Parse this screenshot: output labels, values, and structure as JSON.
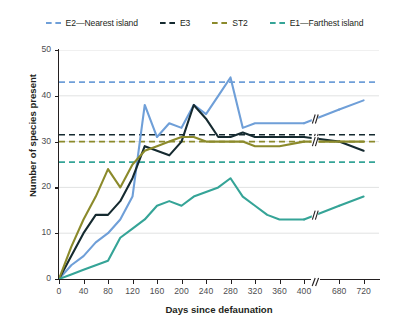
{
  "chart_data": {
    "type": "line",
    "title": "",
    "xlabel": "Days since defaunation",
    "ylabel": "Number of species present",
    "xlim": [
      0,
      740
    ],
    "ylim": [
      0,
      50
    ],
    "grid": "horizontal",
    "legend_position": "top",
    "axis_break": {
      "present": true,
      "after": 420,
      "resume": 650,
      "marker": "//"
    },
    "xticks": [
      0,
      40,
      80,
      120,
      160,
      200,
      240,
      280,
      320,
      360,
      400,
      680,
      720
    ],
    "yticks": [
      0,
      10,
      20,
      30,
      40,
      50
    ],
    "series": [
      {
        "name": "E2—Nearest island",
        "key": "e2",
        "color": "#6f9fd8",
        "style": "solid",
        "reference_line": 43,
        "x": [
          0,
          20,
          40,
          60,
          80,
          100,
          120,
          140,
          160,
          180,
          200,
          220,
          240,
          260,
          280,
          300,
          320,
          340,
          360,
          400,
          680,
          720
        ],
        "y": [
          0,
          3,
          5,
          8,
          10,
          13,
          18,
          38,
          31,
          34,
          33,
          38,
          36,
          40,
          44,
          33,
          34,
          34,
          34,
          34,
          37,
          39
        ]
      },
      {
        "name": "E3",
        "key": "e3",
        "color": "#152a30",
        "style": "solid",
        "reference_line": 31.5,
        "x": [
          0,
          20,
          40,
          60,
          80,
          100,
          120,
          140,
          160,
          180,
          200,
          220,
          240,
          260,
          280,
          300,
          320,
          340,
          360,
          400,
          680,
          720
        ],
        "y": [
          0,
          5,
          10,
          14,
          14,
          17,
          22,
          29,
          28,
          27,
          30,
          38,
          35,
          31,
          31,
          32,
          31,
          31,
          31,
          31,
          30,
          28
        ]
      },
      {
        "name": "ST2",
        "key": "st2",
        "color": "#8b8a2b",
        "style": "solid",
        "reference_line": 30,
        "x": [
          0,
          20,
          40,
          60,
          80,
          100,
          120,
          140,
          160,
          180,
          200,
          220,
          240,
          260,
          280,
          300,
          320,
          340,
          360,
          400,
          680,
          720
        ],
        "y": [
          0,
          7,
          13,
          18,
          24,
          20,
          25,
          28,
          29,
          30,
          31,
          31,
          30,
          30,
          30,
          30,
          29,
          29,
          29,
          30,
          30,
          30
        ]
      },
      {
        "name": "E1—Farthest island",
        "key": "e1",
        "color": "#35a497",
        "style": "solid",
        "reference_line": 25.5,
        "x": [
          0,
          20,
          40,
          60,
          80,
          100,
          120,
          140,
          160,
          180,
          200,
          220,
          240,
          260,
          280,
          300,
          320,
          340,
          360,
          400,
          680,
          720
        ],
        "y": [
          0,
          1,
          2,
          3,
          4,
          9,
          11,
          13,
          16,
          17,
          16,
          18,
          19,
          20,
          22,
          18,
          16,
          14,
          13,
          13,
          16,
          18
        ]
      }
    ]
  },
  "legend": {
    "items": [
      {
        "label": "E2—Nearest island",
        "color": "#6f9fd8"
      },
      {
        "label": "E3",
        "color": "#152a30"
      },
      {
        "label": "ST2",
        "color": "#8b8a2b"
      },
      {
        "label": "E1—Farthest island",
        "color": "#35a497"
      }
    ]
  },
  "axes": {
    "y_title": "Number of species present",
    "x_title": "Days since defaunation",
    "y_tick_labels": [
      "0",
      "10",
      "20",
      "30",
      "40",
      "50"
    ],
    "x_tick_labels": [
      "0",
      "40",
      "80",
      "120",
      "160",
      "200",
      "240",
      "280",
      "320",
      "360",
      "400",
      "680",
      "720"
    ]
  },
  "colors": {
    "axis": "#231f20",
    "grid": "#d9dadb",
    "tick_text": "#4d4d4f",
    "background": "#ffffff"
  }
}
